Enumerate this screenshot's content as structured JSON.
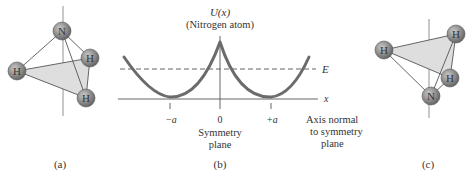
{
  "panel_a": {
    "caption": "(a)",
    "atoms": [
      {
        "label": "N",
        "role": "nitrogen"
      },
      {
        "label": "H",
        "role": "hydrogen-left"
      },
      {
        "label": "H",
        "role": "hydrogen-right"
      },
      {
        "label": "H",
        "role": "hydrogen-bottom"
      }
    ]
  },
  "panel_b": {
    "caption": "(b)",
    "y_label": "U(x)",
    "y_sublabel": "(Nitrogen atom)",
    "x_label": "x",
    "energy_label": "E",
    "ticks": [
      "−a",
      "0",
      "+a"
    ],
    "zero_caption_line1": "Symmetry",
    "zero_caption_line2": "plane",
    "axis_caption_line1": "Axis normal",
    "axis_caption_line2": "to symmetry",
    "axis_caption_line3": "plane"
  },
  "panel_c": {
    "caption": "(c)",
    "atoms": [
      {
        "label": "H",
        "role": "hydrogen-left"
      },
      {
        "label": "H",
        "role": "hydrogen-top-right"
      },
      {
        "label": "H",
        "role": "hydrogen-bottom"
      },
      {
        "label": "N",
        "role": "nitrogen"
      }
    ]
  },
  "colors": {
    "curve": "#6b6b6b",
    "atom_fill": "#8a8a8a",
    "plane_fill": "#dcdcdc",
    "line": "#555555"
  }
}
